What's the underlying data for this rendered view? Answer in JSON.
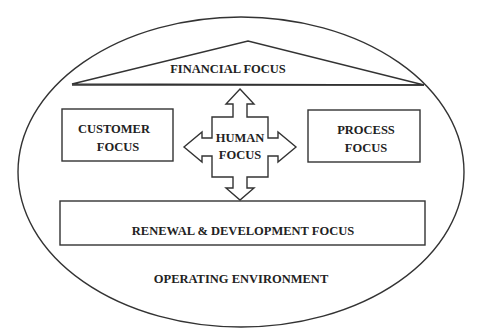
{
  "diagram": {
    "outer": {
      "label": "OPERATING ENVIRONMENT"
    },
    "roof": {
      "label": "FINANCIAL FOCUS"
    },
    "left_box": {
      "line1": "CUSTOMER",
      "line2": "FOCUS"
    },
    "center": {
      "line1": "HUMAN",
      "line2": "FOCUS"
    },
    "right_box": {
      "line1": "PROCESS",
      "line2": "FOCUS"
    },
    "base": {
      "label": "RENEWAL & DEVELOPMENT FOCUS"
    },
    "colors": {
      "stroke": "#333333",
      "text": "#222222",
      "background": "#ffffff"
    }
  }
}
